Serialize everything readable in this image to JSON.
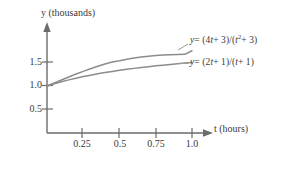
{
  "chart_data": {
    "type": "line",
    "title": "",
    "subtitle": "",
    "xlabel": "t (hours)",
    "ylabel": "y (thousands)",
    "xlim": [
      0,
      1.18
    ],
    "ylim": [
      0,
      2.0
    ],
    "grid": false,
    "legend_position": "inline-right-of-curves",
    "xticks": [
      "0.25",
      "0.5",
      "0.75",
      "1.0"
    ],
    "xtick_values": [
      0.25,
      0.5,
      0.75,
      1.0
    ],
    "yticks": [
      "1.5",
      "1.0",
      "0.5"
    ],
    "ytick_values": [
      1.5,
      1.0,
      0.5
    ],
    "axis_arrows": {
      "x": true,
      "y": true
    },
    "series": [
      {
        "name": "y = (4t + 3)/(t² + 3)",
        "label_parts": {
          "lhs": "y",
          "eq": "= (4",
          "var1": "t",
          "mid": "+ 3)/(",
          "var2": "t",
          "exp": "2",
          "rhs": "+ 3)"
        },
        "color": "#8c8c8c",
        "x": [
          0.0,
          0.05,
          0.1,
          0.15,
          0.2,
          0.25,
          0.3,
          0.35,
          0.4,
          0.45,
          0.5,
          0.55,
          0.6,
          0.65,
          0.7,
          0.75,
          0.8,
          0.85,
          0.9,
          0.95,
          1.0
        ],
        "values": [
          1.0,
          1.064,
          1.129,
          1.192,
          1.254,
          1.312,
          1.368,
          1.419,
          1.468,
          1.512,
          1.538,
          1.569,
          1.595,
          1.617,
          1.635,
          1.649,
          1.659,
          1.667,
          1.671,
          1.673,
          1.75
        ]
      },
      {
        "name": "y = (2t + 1)/(t + 1)",
        "label_parts": {
          "lhs": "y",
          "eq": "= (2",
          "var1": "t",
          "mid": "+ 1)/(",
          "var2": "t",
          "exp": "",
          "rhs": "+ 1)"
        },
        "color": "#8c8c8c",
        "x": [
          0.0,
          0.05,
          0.1,
          0.15,
          0.2,
          0.25,
          0.3,
          0.35,
          0.4,
          0.45,
          0.5,
          0.55,
          0.6,
          0.65,
          0.7,
          0.75,
          0.8,
          0.85,
          0.9,
          0.95,
          1.0
        ],
        "values": [
          1.0,
          1.048,
          1.091,
          1.13,
          1.167,
          1.2,
          1.231,
          1.259,
          1.286,
          1.31,
          1.333,
          1.355,
          1.375,
          1.394,
          1.412,
          1.429,
          1.444,
          1.459,
          1.474,
          1.487,
          1.5
        ]
      }
    ],
    "annotations": [
      {
        "name": "origin-value",
        "text": "1.0",
        "note": "both curves originate at y = 1.0 when t = 0"
      }
    ]
  },
  "colors": {
    "axis": "#6b6b6b",
    "curve": "#8c8c8c",
    "text": "#3a3a3a",
    "background": "#ffffff"
  }
}
